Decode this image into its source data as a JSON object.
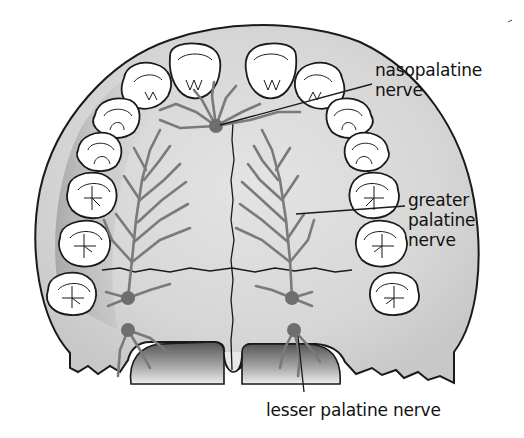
{
  "figure": {
    "colors": {
      "background": "#ffffff",
      "palate_fill": "#dcdcdc",
      "palate_shadow": "#9a9a9a",
      "tooth_fill": "#ffffff",
      "outline": "#1a1a1a",
      "nerve": "#7a7a7a",
      "nerve_node": "#6e6e6e"
    }
  },
  "labels": {
    "nasopalatine": [
      "nasopalatine",
      "nerve"
    ],
    "greater_palatine": [
      "greater",
      "palatine",
      "nerve"
    ],
    "lesser_palatine": [
      "lesser palatine nerve"
    ]
  }
}
